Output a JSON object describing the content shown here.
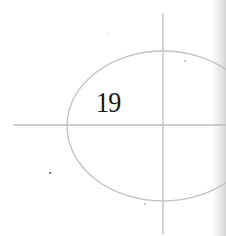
{
  "diagram": {
    "label": "19",
    "colors": {
      "line": "#bdbdbd",
      "text": "#151515",
      "background": "#ffffff",
      "page_edge": "#d6d6d6"
    },
    "shapes": {
      "ellipse": {
        "cx": 163,
        "cy": 126,
        "rx": 96,
        "ry": 75
      },
      "vertical_axis": {
        "x": 163,
        "y1": 13,
        "y2": 234
      },
      "horizontal_axis": {
        "y": 125,
        "x1": 13,
        "x2": 226
      }
    },
    "specks": [
      {
        "x": 50,
        "y": 173
      },
      {
        "x": 145,
        "y": 204
      },
      {
        "x": 185,
        "y": 61
      },
      {
        "x": 107,
        "y": 33
      }
    ]
  }
}
